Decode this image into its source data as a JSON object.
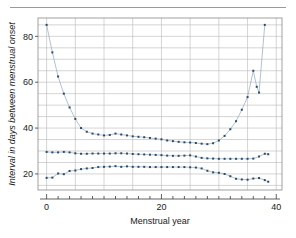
{
  "figure": {
    "rule_label": "top-rule",
    "background": "#ffffff"
  },
  "chart_data": {
    "type": "line",
    "title": "",
    "subtitle": "",
    "xlabel": "Menstrual year",
    "ylabel": "Interval in days between menstrual onset",
    "xlim": [
      -1.5,
      41
    ],
    "ylim": [
      13,
      88
    ],
    "xticks": [
      0,
      20,
      40
    ],
    "xtick_labels": [
      "0",
      "20",
      "40"
    ],
    "yticks": [
      20,
      40,
      60,
      80
    ],
    "ytick_labels": [
      "20",
      "40",
      "60",
      "80"
    ],
    "x_minor_tick_step": 2,
    "grid": true,
    "grid_x_step": 5,
    "grid_y_step": 5,
    "grid_color": "#b9b9b9",
    "legend": "none",
    "marker": "dot",
    "marker_color": "#2c4a66",
    "line_color": "#8fa8bd",
    "series": [
      {
        "name": "upper percentile",
        "values": [
          [
            0,
            85.0
          ],
          [
            1,
            73.0
          ],
          [
            2,
            62.5
          ],
          [
            3,
            55.0
          ],
          [
            4,
            49.0
          ],
          [
            5,
            44.0
          ],
          [
            6,
            40.0
          ],
          [
            7,
            38.4
          ],
          [
            8,
            37.6
          ],
          [
            9,
            37.2
          ],
          [
            10,
            36.8
          ],
          [
            11,
            37.0
          ],
          [
            12,
            37.6
          ],
          [
            13,
            37.2
          ],
          [
            14,
            36.8
          ],
          [
            15,
            36.4
          ],
          [
            16,
            36.2
          ],
          [
            17,
            36.0
          ],
          [
            18,
            35.7
          ],
          [
            19,
            35.4
          ],
          [
            20,
            35.1
          ],
          [
            21,
            34.6
          ],
          [
            22,
            34.3
          ],
          [
            23,
            34.0
          ],
          [
            24,
            33.8
          ],
          [
            25,
            33.7
          ],
          [
            26,
            33.5
          ],
          [
            27,
            33.2
          ],
          [
            28,
            33.0
          ],
          [
            29,
            33.4
          ],
          [
            30,
            34.6
          ],
          [
            31,
            36.6
          ],
          [
            32,
            39.5
          ],
          [
            33,
            43.0
          ],
          [
            34,
            48.0
          ],
          [
            35,
            53.5
          ],
          [
            36,
            65.0
          ],
          [
            36.6,
            58.0
          ],
          [
            37,
            55.5
          ],
          [
            38,
            85.0
          ]
        ]
      },
      {
        "name": "median",
        "values": [
          [
            0,
            29.6
          ],
          [
            1,
            29.4
          ],
          [
            2,
            29.4
          ],
          [
            3,
            29.6
          ],
          [
            4,
            29.4
          ],
          [
            5,
            29.0
          ],
          [
            6,
            28.8
          ],
          [
            7,
            28.8
          ],
          [
            8,
            28.9
          ],
          [
            9,
            28.9
          ],
          [
            10,
            28.9
          ],
          [
            11,
            28.9
          ],
          [
            12,
            29.0
          ],
          [
            13,
            29.0
          ],
          [
            14,
            28.9
          ],
          [
            15,
            28.7
          ],
          [
            16,
            28.6
          ],
          [
            17,
            28.5
          ],
          [
            18,
            28.4
          ],
          [
            19,
            28.3
          ],
          [
            20,
            28.2
          ],
          [
            21,
            28.0
          ],
          [
            22,
            27.9
          ],
          [
            23,
            27.9
          ],
          [
            24,
            28.0
          ],
          [
            25,
            28.1
          ],
          [
            26,
            27.6
          ],
          [
            27,
            27.0
          ],
          [
            28,
            26.8
          ],
          [
            29,
            26.7
          ],
          [
            30,
            26.6
          ],
          [
            31,
            26.6
          ],
          [
            32,
            26.6
          ],
          [
            33,
            26.6
          ],
          [
            34,
            26.6
          ],
          [
            35,
            26.6
          ],
          [
            36,
            26.7
          ],
          [
            37,
            27.6
          ],
          [
            38,
            28.8
          ],
          [
            38.6,
            28.6
          ]
        ]
      },
      {
        "name": "lower percentile",
        "values": [
          [
            0,
            18.3
          ],
          [
            1,
            18.4
          ],
          [
            2,
            20.2
          ],
          [
            3,
            19.9
          ],
          [
            4,
            21.3
          ],
          [
            5,
            21.5
          ],
          [
            6,
            22.1
          ],
          [
            7,
            22.4
          ],
          [
            8,
            22.6
          ],
          [
            9,
            23.0
          ],
          [
            10,
            23.1
          ],
          [
            11,
            23.2
          ],
          [
            12,
            23.4
          ],
          [
            13,
            23.1
          ],
          [
            14,
            23.3
          ],
          [
            15,
            23.1
          ],
          [
            16,
            23.1
          ],
          [
            17,
            23.1
          ],
          [
            18,
            23.0
          ],
          [
            19,
            23.0
          ],
          [
            20,
            23.0
          ],
          [
            21,
            23.0
          ],
          [
            22,
            23.0
          ],
          [
            23,
            23.0
          ],
          [
            24,
            23.0
          ],
          [
            25,
            22.9
          ],
          [
            26,
            22.8
          ],
          [
            27,
            22.4
          ],
          [
            28,
            21.4
          ],
          [
            29,
            20.7
          ],
          [
            30,
            20.5
          ],
          [
            31,
            20.0
          ],
          [
            32,
            19.0
          ],
          [
            33,
            17.9
          ],
          [
            34,
            17.6
          ],
          [
            35,
            17.5
          ],
          [
            36,
            18.0
          ],
          [
            37,
            18.2
          ],
          [
            38,
            17.3
          ],
          [
            38.6,
            16.6
          ]
        ]
      }
    ]
  }
}
